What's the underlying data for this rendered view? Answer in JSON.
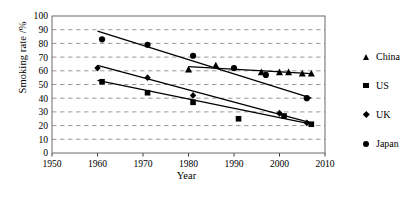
{
  "chart_data": {
    "type": "scatter",
    "title": "",
    "xlabel": "Year",
    "ylabel": "Smoking rate /%",
    "xlim": [
      1950,
      2010
    ],
    "ylim": [
      0,
      100
    ],
    "xticks": [
      1950,
      1960,
      1970,
      1980,
      1990,
      2000,
      2010
    ],
    "yticks": [
      0,
      10,
      20,
      30,
      40,
      50,
      60,
      70,
      80,
      90,
      100
    ],
    "grid": "horizontal-dashed",
    "legend_position": "right-outside",
    "series": [
      {
        "name": "China",
        "marker": "triangle",
        "points": [
          {
            "x": 1980,
            "y": 61
          },
          {
            "x": 1986,
            "y": 64
          },
          {
            "x": 1996,
            "y": 59
          },
          {
            "x": 2000,
            "y": 59
          },
          {
            "x": 2002,
            "y": 59
          },
          {
            "x": 2005,
            "y": 58
          },
          {
            "x": 2007,
            "y": 58
          }
        ],
        "trend_start": {
          "x": 1980,
          "y": 63
        },
        "trend_end": {
          "x": 2007,
          "y": 58
        }
      },
      {
        "name": "US",
        "marker": "square",
        "points": [
          {
            "x": 1961,
            "y": 52
          },
          {
            "x": 1971,
            "y": 44
          },
          {
            "x": 1981,
            "y": 37
          },
          {
            "x": 1991,
            "y": 25
          },
          {
            "x": 2001,
            "y": 27
          },
          {
            "x": 2007,
            "y": 21
          }
        ],
        "trend_start": {
          "x": 1960,
          "y": 53
        },
        "trend_end": {
          "x": 2007,
          "y": 21
        }
      },
      {
        "name": "UK",
        "marker": "diamond",
        "points": [
          {
            "x": 1960,
            "y": 62
          },
          {
            "x": 1971,
            "y": 55
          },
          {
            "x": 1981,
            "y": 42
          },
          {
            "x": 2000,
            "y": 29
          },
          {
            "x": 2006,
            "y": 22
          }
        ],
        "trend_start": {
          "x": 1960,
          "y": 64
        },
        "trend_end": {
          "x": 2007,
          "y": 22
        }
      },
      {
        "name": "Japan",
        "marker": "circle",
        "points": [
          {
            "x": 1961,
            "y": 83
          },
          {
            "x": 1971,
            "y": 79
          },
          {
            "x": 1981,
            "y": 71
          },
          {
            "x": 1990,
            "y": 62
          },
          {
            "x": 1997,
            "y": 57
          },
          {
            "x": 2006,
            "y": 40
          }
        ],
        "trend_start": {
          "x": 1960,
          "y": 89
        },
        "trend_end": {
          "x": 2007,
          "y": 40
        }
      }
    ]
  },
  "legend": {
    "items": [
      {
        "label": "China",
        "marker": "triangle-icon"
      },
      {
        "label": "US",
        "marker": "square-icon"
      },
      {
        "label": "UK",
        "marker": "diamond-icon"
      },
      {
        "label": "Japan",
        "marker": "circle-icon"
      }
    ]
  },
  "axes": {
    "y_title": "Smoking rate /%",
    "x_title": "Year",
    "y_tick_labels": [
      "0",
      "10",
      "20",
      "30",
      "40",
      "50",
      "60",
      "70",
      "80",
      "90",
      "100"
    ],
    "x_tick_labels": [
      "1950",
      "1960",
      "1970",
      "1980",
      "1990",
      "2000",
      "2010"
    ]
  }
}
